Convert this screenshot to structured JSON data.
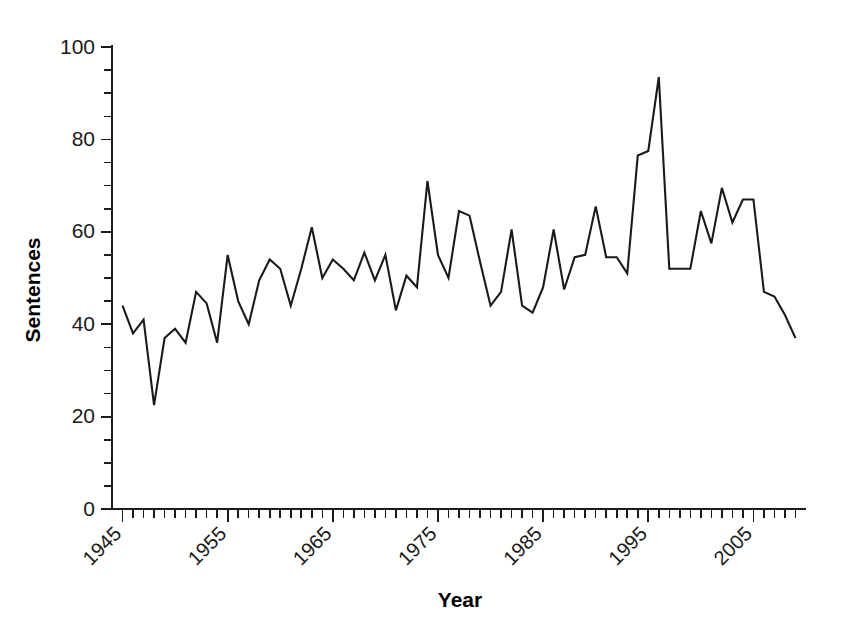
{
  "chart_data": {
    "type": "line",
    "title": "",
    "xlabel": "Year",
    "ylabel": "Sentences",
    "xlim": [
      1944,
      2010
    ],
    "ylim": [
      0,
      100
    ],
    "grid": false,
    "legend": null,
    "y_ticks_major": [
      0,
      20,
      40,
      60,
      80,
      100
    ],
    "y_tick_labels": [
      "0",
      "20",
      "40",
      "60",
      "80",
      "100"
    ],
    "y_tick_minor_step": 5,
    "x_ticks_major": [
      1945,
      1955,
      1965,
      1975,
      1985,
      1995,
      2005
    ],
    "x_tick_labels": [
      "1945",
      "1955",
      "1965",
      "1975",
      "1985",
      "1995",
      "2005"
    ],
    "x_tick_minor_step": 1,
    "line_color": "#1a1a1a",
    "x": [
      1945,
      1946,
      1947,
      1948,
      1949,
      1950,
      1951,
      1952,
      1953,
      1954,
      1955,
      1956,
      1957,
      1958,
      1959,
      1960,
      1961,
      1962,
      1963,
      1964,
      1965,
      1966,
      1967,
      1968,
      1969,
      1970,
      1971,
      1972,
      1973,
      1974,
      1975,
      1976,
      1977,
      1978,
      1979,
      1980,
      1981,
      1982,
      1983,
      1984,
      1985,
      1986,
      1987,
      1988,
      1989,
      1990,
      1991,
      1992,
      1993,
      1994,
      1995,
      1996,
      1997,
      1998,
      1999,
      2000,
      2001,
      2002,
      2003,
      2004,
      2005,
      2006,
      2007,
      2008,
      2009
    ],
    "values": [
      44,
      38,
      41,
      22.5,
      37,
      39,
      36,
      47,
      44.5,
      36,
      55,
      45,
      40,
      49.5,
      54,
      52,
      44,
      52,
      61,
      50,
      54,
      52,
      49.5,
      55.5,
      49.5,
      55,
      43,
      50.5,
      48,
      71,
      55,
      50,
      64.5,
      63.5,
      53.5,
      44,
      47,
      60.5,
      44,
      42.5,
      48,
      60.5,
      47.5,
      54.5,
      55,
      65.5,
      54.5,
      54.5,
      51,
      76.5,
      77.5,
      93.5,
      52,
      52,
      52,
      64.5,
      57.5,
      69.5,
      62,
      67,
      67,
      47,
      46,
      42,
      37
    ]
  }
}
